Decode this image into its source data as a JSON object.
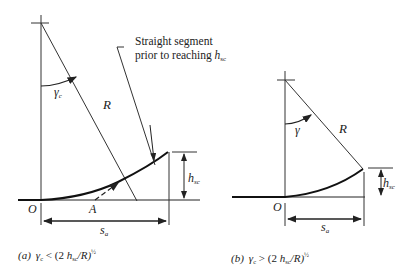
{
  "figure_a": {
    "angle_label": "γ",
    "angle_sub": "c",
    "radius_label": "R",
    "callout_line1": "Straight segment",
    "callout_line2": "prior to reaching ",
    "callout_h": "h",
    "callout_h_sub": "sc",
    "height_label": "h",
    "height_sub": "sc",
    "origin_label": "O",
    "point_label": "A",
    "span_label": "s",
    "span_sub": "a",
    "caption_tag": "(a)",
    "caption_gamma": "γ",
    "caption_gamma_sub": "c",
    "caption_rel": " < (2 ",
    "caption_h": "h",
    "caption_h_sub": "sc",
    "caption_tail": "/R)",
    "caption_exp": "½"
  },
  "figure_b": {
    "angle_label": "γ",
    "radius_label": "R",
    "height_label": "h",
    "height_sub": "sc",
    "origin_label": "O",
    "span_label": "s",
    "span_sub": "a",
    "caption_tag": "(b)",
    "caption_gamma": "γ",
    "caption_gamma_sub": "c",
    "caption_rel": " > (2 ",
    "caption_h": "h",
    "caption_h_sub": "sc",
    "caption_tail": "/R)",
    "caption_exp": "½"
  }
}
